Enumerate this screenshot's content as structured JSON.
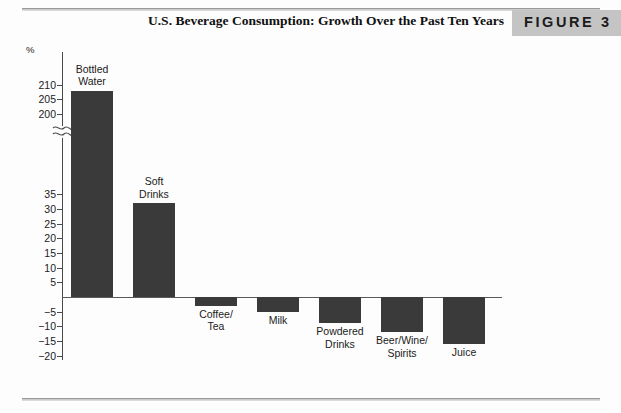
{
  "figure": {
    "number_label": "FIGURE 3",
    "title": "U.S. Beverage Consumption: Growth Over the Past Ten Years"
  },
  "chart_data": {
    "type": "bar",
    "title": "U.S. Beverage Consumption: Growth Over the Past Ten Years",
    "xlabel": "",
    "ylabel": "%",
    "unit_symbol": "%",
    "categories": [
      "Bottled Water",
      "Soft Drinks",
      "Coffee/ Tea",
      "Milk",
      "Powdered Drinks",
      "Beer/Wine/ Spirits",
      "Juice"
    ],
    "category_labels": [
      "Bottled\nWater",
      "Soft\nDrinks",
      "Coffee/\nTea",
      "Milk",
      "Powdered\nDrinks",
      "Beer/Wine/\nSpirits",
      "Juice"
    ],
    "values": [
      208,
      32,
      -3,
      -5,
      -9,
      -12,
      -16
    ],
    "tick_labels": [
      "210",
      "205",
      "200",
      "35",
      "30",
      "25",
      "20",
      "15",
      "10",
      "5",
      "",
      "−5",
      "−10",
      "−15",
      "−20"
    ],
    "tick_values": [
      210,
      205,
      200,
      35,
      30,
      25,
      20,
      15,
      10,
      5,
      0,
      -5,
      -10,
      -15,
      -20
    ],
    "axis_break": true,
    "axis_break_between": [
      200,
      35
    ],
    "ylim": [
      -20,
      210
    ],
    "grid": false,
    "legend": null,
    "bar_color": "#3a3a3a",
    "axis_color": "#4a4a4a"
  }
}
